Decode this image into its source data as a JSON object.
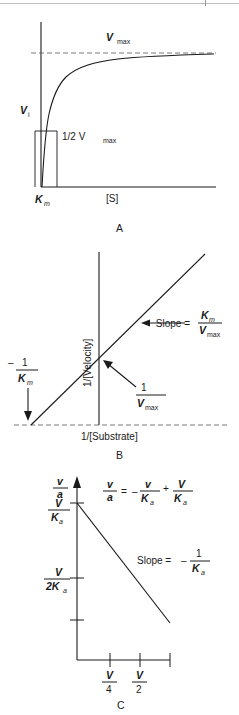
{
  "figure": {
    "ink_color": "#1a1a1a",
    "background": "#ffffff"
  },
  "panel_a": {
    "letter": "A",
    "y_axis_label": "V",
    "y_axis_label_sub": "i",
    "x_axis_label": "[S]",
    "asymptote_label": "V",
    "asymptote_label_sub": "max",
    "half_max_label": "1/2 V",
    "half_max_label_sub": "max",
    "km_label": "K",
    "km_label_sub": "m"
  },
  "panel_b": {
    "letter": "B",
    "y_axis_label": "1/[Velocity]",
    "x_axis_label": "1/[Substrate]",
    "slope_label": "Slope =",
    "slope_numerator": "K",
    "slope_numerator_sub": "m",
    "slope_denominator": "V",
    "slope_denominator_sub": "max",
    "y_intercept_numerator": "1",
    "y_intercept_denominator": "V",
    "y_intercept_denominator_sub": "max",
    "x_intercept_sign": "–",
    "x_intercept_numerator": "1",
    "x_intercept_denominator": "K",
    "x_intercept_denominator_sub": "m"
  },
  "panel_c": {
    "letter": "C",
    "y_axis_top_numerator": "v",
    "y_axis_top_denominator": "a",
    "y_intercept_numerator": "V",
    "y_intercept_denominator": "K",
    "y_intercept_denominator_sub": "a",
    "y_half_numerator": "V",
    "y_half_denominator": "2K",
    "y_half_denominator_sub": "a",
    "equation": {
      "lhs_numerator": "v",
      "lhs_denominator": "a",
      "equals": "=",
      "minus": "–",
      "term1_numerator": "v",
      "term1_denominator": "K",
      "term1_denominator_sub": "a",
      "plus": "+",
      "term2_numerator": "V",
      "term2_denominator": "K",
      "term2_denominator_sub": "a"
    },
    "slope_label": "Slope =",
    "slope_sign": "–",
    "slope_numerator": "1",
    "slope_denominator": "K",
    "slope_denominator_sub": "a",
    "x_tick_1_numerator": "V",
    "x_tick_1_denominator": "4",
    "x_tick_2_numerator": "V",
    "x_tick_2_denominator": "2"
  }
}
